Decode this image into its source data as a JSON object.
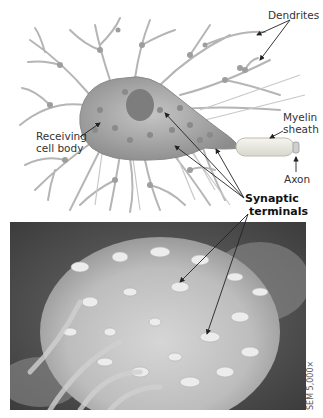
{
  "figure": {
    "labels": {
      "dendrites": "Dendrites",
      "myelin_sheath_line1": "Myelin",
      "myelin_sheath_line2": "sheath",
      "axon": "Axon",
      "receiving_cell_body_line1": "Receiving",
      "receiving_cell_body_line2": "cell body",
      "synaptic_terminals_line1": "Synaptic",
      "synaptic_terminals_line2": "terminals"
    },
    "micrograph_caption": "SEM 5,000×",
    "colors": {
      "background": "#ffffff",
      "illustration_gray": "#a8a8a8",
      "cell_body": "#9a9a9a",
      "myelin": "#ecebe4",
      "sem_dark": "#4a4a4a",
      "sem_light": "#d8d8d8",
      "arrow": "#222222"
    }
  }
}
